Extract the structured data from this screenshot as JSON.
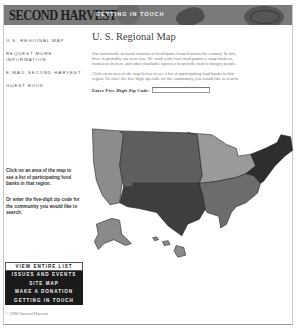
{
  "header": {
    "logo_text": "SECOND HARVEST",
    "section_title": "GETTING IN TOUCH"
  },
  "sidebar": {
    "items": [
      {
        "label": "U.S. REGIONAL MAP"
      },
      {
        "label": "REQUEST MORE INFORMATION"
      },
      {
        "label": "E-MAIL SECOND HARVEST"
      },
      {
        "label": "GUEST BOOK"
      }
    ],
    "note_map": "Click on an area of the map to see a list of participating food banks in that region.",
    "note_zip": "Or enter the five-digit zip code for the community you would like to search.",
    "buttons": [
      {
        "label": "VIEW ENTIRE LIST",
        "style": "light"
      },
      {
        "label": "ISSUES AND EVENTS",
        "style": "dark"
      },
      {
        "label": "SITE MAP",
        "style": "dark"
      },
      {
        "label": "MAKE A DONATION",
        "style": "dark"
      },
      {
        "label": "GETTING IN TOUCH",
        "style": "dark"
      }
    ],
    "copyright": "© 1996 Second Harvest"
  },
  "main": {
    "title": "U. S.  Regional Map",
    "paragraph_1": "Our nationwide network consists of food banks located across the country. In fact, there is probably one near you. We work with local food pantries, soup kitchens, homeless shelters, and other charitable agencies to provide food to hungry people.",
    "paragraph_2": "Click on an area of the map below to see a list of participating food banks in that region. Or enter the five-digit zip code for the community you would like to search.",
    "zip_label": "Enter Five-Digit Zip Code:",
    "zip_value": "",
    "zip_placeholder": ""
  },
  "map": {
    "regions": [
      {
        "name": "Pacific / West",
        "color": "#8c8c8c"
      },
      {
        "name": "Mountain",
        "color": "#5e5e5e"
      },
      {
        "name": "Southwest",
        "color": "#3e3e3e"
      },
      {
        "name": "Midwest",
        "color": "#9a9a9a"
      },
      {
        "name": "Southeast",
        "color": "#6c6c6c"
      },
      {
        "name": "Northeast",
        "color": "#2e2e2e"
      },
      {
        "name": "Alaska & Hawaii",
        "color": "#8a8a8a"
      }
    ]
  }
}
